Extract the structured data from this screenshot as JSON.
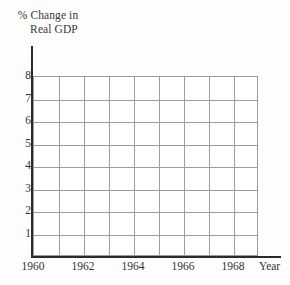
{
  "chart_data": {
    "type": "line",
    "title": "",
    "subtitle": "",
    "ylabel_line1": "% Change in",
    "ylabel_line2": "Real GDP",
    "xlabel": "Year",
    "series": [],
    "x": [],
    "categories": [],
    "values": [],
    "ylim": [
      0,
      8
    ],
    "xlim": [
      1960,
      1969
    ],
    "y_ticks": [
      "8",
      "7",
      "6",
      "5",
      "4",
      "3",
      "2",
      "1"
    ],
    "y_tick_values": [
      8,
      7,
      6,
      5,
      4,
      3,
      2,
      1
    ],
    "x_ticks": [
      "1960",
      "1962",
      "1964",
      "1966",
      "1968"
    ],
    "x_tick_values": [
      1960,
      1962,
      1964,
      1966,
      1968
    ],
    "grid": true,
    "grid_columns": 9,
    "grid_rows": 8,
    "legend": null,
    "legend_position": "none",
    "annotations": []
  },
  "axes": {
    "y_title": {
      "line1": "% Change in",
      "line2": "Real GDP"
    },
    "x_unit": "Year"
  },
  "colors": {
    "background": "#fdfdfd",
    "plot_background": "#ffffff",
    "grid": "#9e9e9e",
    "axis": "#2b2b2b",
    "text": "#333333"
  }
}
